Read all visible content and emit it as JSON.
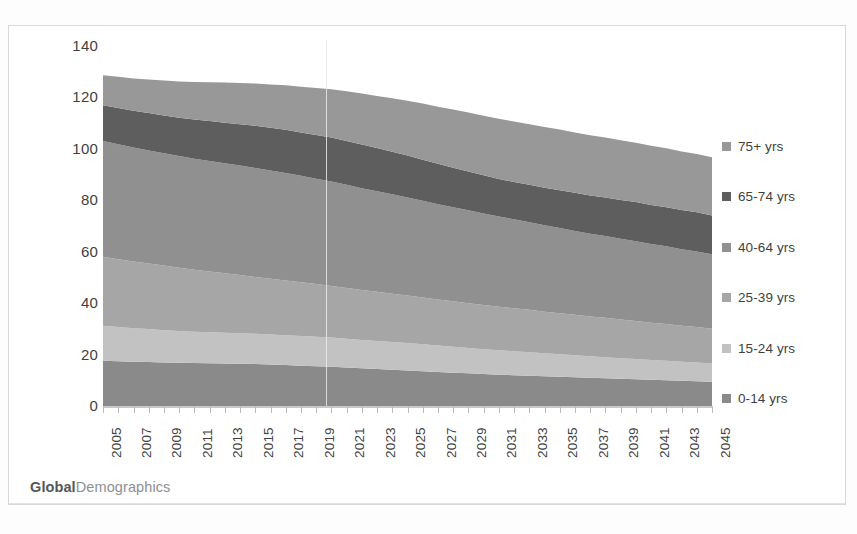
{
  "chart_data": {
    "type": "area",
    "stacked": true,
    "title": "",
    "subtitle": "",
    "xlabel": "",
    "ylabel": "Persons millions",
    "ylim": [
      0,
      140
    ],
    "yticks": [
      0,
      20,
      40,
      60,
      80,
      100,
      120,
      140
    ],
    "xlim": [
      2005,
      2045
    ],
    "grid": false,
    "legend_position": "right",
    "source_note": "GlobalDemographics",
    "x": [
      2005,
      2006,
      2007,
      2008,
      2009,
      2010,
      2011,
      2012,
      2013,
      2014,
      2015,
      2016,
      2017,
      2018,
      2019,
      2020,
      2021,
      2022,
      2023,
      2024,
      2025,
      2026,
      2027,
      2028,
      2029,
      2030,
      2031,
      2032,
      2033,
      2034,
      2035,
      2036,
      2037,
      2038,
      2039,
      2040,
      2041,
      2042,
      2043,
      2044,
      2045
    ],
    "xtick_labels": [
      "2005",
      "2007",
      "2009",
      "2011",
      "2013",
      "2015",
      "2017",
      "2019",
      "2021",
      "2023",
      "2025",
      "2027",
      "2029",
      "2031",
      "2033",
      "2035",
      "2037",
      "2039",
      "2041",
      "2043",
      "2045"
    ],
    "series": [
      {
        "name": "0-14 yrs",
        "color": "#8a8a8a",
        "values": [
          17.6,
          17.4,
          17.2,
          17.1,
          16.9,
          16.8,
          16.7,
          16.6,
          16.5,
          16.4,
          16.3,
          16.1,
          15.9,
          15.7,
          15.5,
          15.3,
          15.0,
          14.7,
          14.4,
          14.1,
          13.8,
          13.5,
          13.2,
          12.9,
          12.7,
          12.4,
          12.2,
          12.0,
          11.8,
          11.6,
          11.4,
          11.2,
          11.0,
          10.8,
          10.6,
          10.4,
          10.2,
          10.0,
          9.8,
          9.6,
          9.4
        ]
      },
      {
        "name": "15-24 yrs",
        "color": "#c2c2c2",
        "values": [
          13.6,
          13.3,
          13.0,
          12.8,
          12.6,
          12.4,
          12.2,
          12.1,
          12.0,
          11.9,
          11.8,
          11.7,
          11.6,
          11.5,
          11.4,
          11.3,
          11.2,
          11.0,
          10.9,
          10.8,
          10.7,
          10.5,
          10.3,
          10.1,
          9.9,
          9.7,
          9.5,
          9.3,
          9.1,
          8.9,
          8.7,
          8.5,
          8.3,
          8.2,
          8.0,
          7.9,
          7.7,
          7.6,
          7.4,
          7.3,
          7.1
        ]
      },
      {
        "name": "25-39 yrs",
        "color": "#a6a6a6",
        "values": [
          26.8,
          26.4,
          26.0,
          25.5,
          25.1,
          24.6,
          24.1,
          23.6,
          23.1,
          22.6,
          22.1,
          21.7,
          21.3,
          20.9,
          20.5,
          20.1,
          19.7,
          19.4,
          19.1,
          18.8,
          18.5,
          18.2,
          17.9,
          17.7,
          17.4,
          17.2,
          16.9,
          16.7,
          16.5,
          16.2,
          16.0,
          15.8,
          15.5,
          15.3,
          15.0,
          14.8,
          14.5,
          14.3,
          14.0,
          13.8,
          13.5
        ]
      },
      {
        "name": "40-64 yrs",
        "color": "#909090",
        "values": [
          45.1,
          44.7,
          44.3,
          44.0,
          43.7,
          43.4,
          43.2,
          43.0,
          42.8,
          42.6,
          42.4,
          42.1,
          41.8,
          41.4,
          41.0,
          40.6,
          40.1,
          39.6,
          39.1,
          38.6,
          38.1,
          37.6,
          37.1,
          36.6,
          36.1,
          35.6,
          35.1,
          34.6,
          34.1,
          33.6,
          33.1,
          32.6,
          32.2,
          31.8,
          31.4,
          31.0,
          30.6,
          30.2,
          29.8,
          29.4,
          29.0
        ]
      },
      {
        "name": "65-74 yrs",
        "color": "#5e5e5e",
        "values": [
          13.9,
          14.1,
          14.3,
          14.5,
          14.7,
          14.9,
          15.2,
          15.5,
          15.8,
          16.1,
          16.4,
          16.6,
          16.8,
          16.9,
          17.0,
          17.1,
          17.1,
          17.0,
          16.8,
          16.6,
          16.3,
          16.0,
          15.7,
          15.4,
          15.1,
          14.8,
          14.6,
          14.5,
          14.5,
          14.6,
          14.7,
          14.8,
          14.9,
          15.0,
          15.1,
          15.2,
          15.2,
          15.2,
          15.2,
          15.2,
          15.1
        ]
      },
      {
        "name": "75+ yrs",
        "color": "#989898",
        "values": [
          11.6,
          12.1,
          12.6,
          13.1,
          13.6,
          14.1,
          14.6,
          15.1,
          15.6,
          16.0,
          16.4,
          16.8,
          17.3,
          17.8,
          18.3,
          18.8,
          19.3,
          19.8,
          20.3,
          20.8,
          21.3,
          21.8,
          22.2,
          22.6,
          22.9,
          23.2,
          23.4,
          23.5,
          23.6,
          23.6,
          23.6,
          23.5,
          23.4,
          23.3,
          23.2,
          23.1,
          23.0,
          22.9,
          22.8,
          22.7,
          22.6
        ]
      }
    ],
    "totals": [
      128.6,
      128.0,
      127.4,
      127.0,
      126.6,
      126.2,
      126.0,
      125.9,
      125.8,
      125.6,
      125.4,
      125.0,
      124.7,
      124.2,
      123.7,
      123.2,
      122.4,
      121.5,
      120.6,
      119.7,
      118.7,
      117.6,
      116.4,
      115.3,
      114.1,
      112.9,
      111.7,
      110.6,
      109.6,
      108.5,
      107.5,
      106.4,
      105.3,
      104.4,
      103.3,
      102.4,
      101.2,
      100.2,
      99.0,
      98.0,
      96.7
    ]
  },
  "axes": {
    "ylabel": "Persons millions",
    "ytick_labels": [
      "140",
      "120",
      "100",
      "80",
      "60",
      "40",
      "20",
      "0"
    ]
  },
  "legend": {
    "items": [
      {
        "label": "75+ yrs",
        "color": "#989898"
      },
      {
        "label": "65-74 yrs",
        "color": "#5e5e5e"
      },
      {
        "label": "40-64 yrs",
        "color": "#909090"
      },
      {
        "label": "25-39 yrs",
        "color": "#a6a6a6"
      },
      {
        "label": "15-24 yrs",
        "color": "#c2c2c2"
      },
      {
        "label": "0-14 yrs",
        "color": "#8a8a8a"
      }
    ]
  },
  "footer": {
    "brand_bold": "Global",
    "brand_light": "Demographics"
  }
}
